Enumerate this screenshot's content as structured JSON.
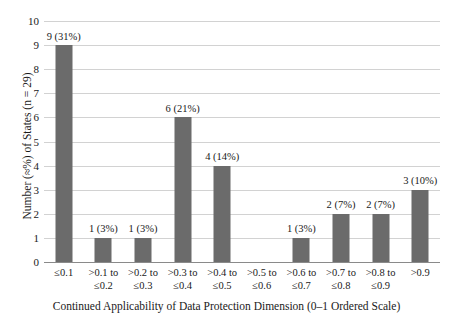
{
  "chart_data": {
    "type": "bar",
    "title": "",
    "xlabel": "Continued Applicability of Data Protection Dimension (0–1 Ordered Scale)",
    "ylabel": "Number (≈%) of States (n = 29)",
    "categories": [
      "≤0.1",
      ">0.1 to ≤0.2",
      ">0.2 to ≤0.3",
      ">0.3 to ≤0.4",
      ">0.4 to ≤0.5",
      ">0.5 to ≤0.6",
      ">0.6 to ≤0.7",
      ">0.7 to ≤0.8",
      ">0.8 to ≤0.9",
      ">0.9"
    ],
    "category_lines": [
      [
        "≤0.1"
      ],
      [
        ">0.1 to",
        "≤0.2"
      ],
      [
        ">0.2 to",
        "≤0.3"
      ],
      [
        ">0.3 to",
        "≤0.4"
      ],
      [
        ">0.4 to",
        "≤0.5"
      ],
      [
        ">0.5 to",
        "≤0.6"
      ],
      [
        ">0.6 to",
        "≤0.7"
      ],
      [
        ">0.7 to",
        "≤0.8"
      ],
      [
        ">0.8 to",
        "≤0.9"
      ],
      [
        ">0.9"
      ]
    ],
    "values": [
      9,
      1,
      1,
      6,
      4,
      0,
      1,
      2,
      2,
      3
    ],
    "percents": [
      31,
      3,
      3,
      21,
      14,
      0,
      3,
      7,
      7,
      10
    ],
    "data_labels": [
      "9 (31%)",
      "1 (3%)",
      "1 (3%)",
      "6 (21%)",
      "4 (14%)",
      "",
      "1 (3%)",
      "2 (7%)",
      "2 (7%)",
      "3 (10%)"
    ],
    "ylim": [
      0,
      10
    ],
    "y_ticks": [
      0,
      1,
      2,
      3,
      4,
      5,
      6,
      7,
      8,
      9,
      10
    ],
    "y_tick_labels": [
      "0",
      "1",
      "2",
      "3",
      "4",
      "5",
      "6",
      "7",
      "8",
      "9",
      "10"
    ],
    "grid": "horizontal",
    "legend": "none",
    "bar_color": "#6b6b6b",
    "grid_color": "#d2d2d2",
    "axis_color": "#8a8a8a",
    "background_color": "#ffffff",
    "n": 29
  }
}
